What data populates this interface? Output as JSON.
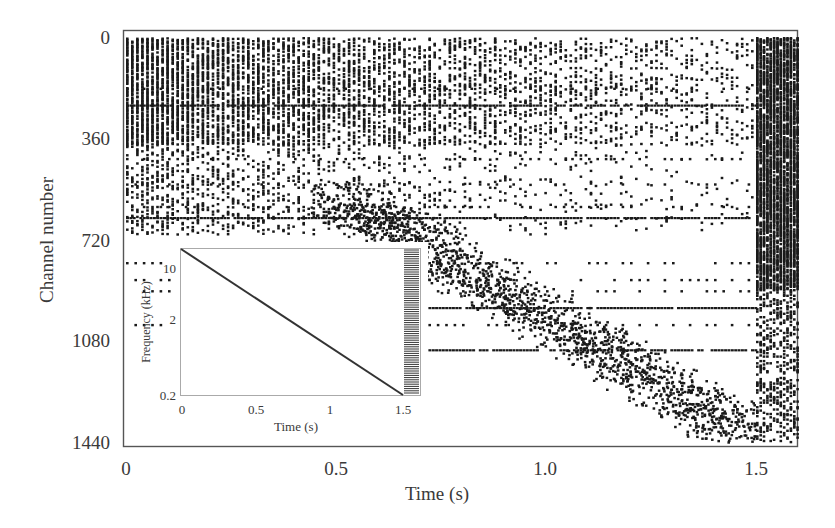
{
  "chart_data": {
    "type": "scatter",
    "title": "",
    "xlabel": "Time (s)",
    "ylabel": "Channel number",
    "xlim": [
      0,
      1.6
    ],
    "ylim": [
      1440,
      0
    ],
    "x_ticks": [
      "0",
      "0.5",
      "1.0",
      "1.5"
    ],
    "y_ticks": [
      "0",
      "360",
      "720",
      "1080",
      "1440"
    ],
    "grid": false,
    "legend": null,
    "colors": {
      "points": "#1a1a1a",
      "frame": "#555555",
      "background": "#ffffff"
    },
    "features": {
      "sweep_onset_s": 0.0,
      "sweep_offset_s": 1.5,
      "sustained_channels": [
        240,
        640,
        960,
        1110
      ],
      "post_sweep_burst_s": [
        1.5,
        1.6
      ],
      "diagonal_activity": {
        "from": {
          "t": 0.5,
          "ch": 560
        },
        "to": {
          "t": 1.5,
          "ch": 1430
        }
      }
    },
    "inset": {
      "type": "line",
      "xlabel": "Time (s)",
      "ylabel": "Frequency (kHz)",
      "x_ticks": [
        "0",
        "0.5",
        "1",
        "1.5"
      ],
      "y_ticks": [
        "10",
        "2",
        "0.2"
      ],
      "y_scale": "log",
      "xlim": [
        0,
        1.6
      ],
      "ylim": [
        0.2,
        16
      ],
      "series": [
        {
          "name": "sweep",
          "x": [
            0,
            1.5
          ],
          "values": [
            16,
            0.2
          ]
        }
      ],
      "post_sweep": "click train from 1.5 s to 1.6 s (hatched bar)"
    }
  }
}
